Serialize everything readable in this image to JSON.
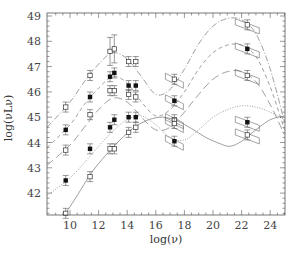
{
  "chart_data": {
    "type": "scatter",
    "title": "",
    "xlabel": "log(ν)",
    "ylabel": "log(νLν)",
    "xlim": [
      8.4,
      25.0
    ],
    "ylim": [
      41.05,
      49.2
    ],
    "grid": false,
    "legend": "none",
    "x_ticks": [
      10,
      12,
      14,
      16,
      18,
      20,
      22,
      24
    ],
    "y_ticks": [
      42,
      43,
      44,
      45,
      46,
      47,
      48,
      49
    ],
    "series": [
      {
        "name": "sequence-1",
        "marker": "open",
        "line": "dotted-long",
        "points": [
          [
            9.7,
            45.4
          ],
          [
            11.4,
            46.65
          ],
          [
            12.8,
            47.6
          ],
          [
            13.1,
            47.7
          ],
          [
            14.1,
            47.2
          ],
          [
            14.6,
            47.2
          ],
          [
            17.3,
            46.5
          ],
          [
            22.4,
            48.65
          ]
        ],
        "curve": [
          [
            8.4,
            44.6
          ],
          [
            10,
            45.6
          ],
          [
            11,
            46.4
          ],
          [
            12,
            47.1
          ],
          [
            13,
            47.55
          ],
          [
            14,
            47.3
          ],
          [
            15,
            46.6
          ],
          [
            16,
            45.9
          ],
          [
            17,
            46.1
          ],
          [
            18,
            46.9
          ],
          [
            19,
            47.9
          ],
          [
            20,
            48.6
          ],
          [
            21,
            48.9
          ],
          [
            22,
            48.85
          ],
          [
            23,
            48.3
          ],
          [
            24,
            46.9
          ],
          [
            25,
            44.8
          ]
        ]
      },
      {
        "name": "sequence-2",
        "marker": "filled",
        "line": "short-dash",
        "points": [
          [
            9.7,
            44.5
          ],
          [
            11.4,
            45.8
          ],
          [
            12.8,
            46.6
          ],
          [
            13.1,
            46.75
          ],
          [
            14.1,
            46.25
          ],
          [
            14.6,
            46.25
          ],
          [
            17.3,
            45.65
          ],
          [
            22.4,
            47.7
          ]
        ],
        "curve": [
          [
            8.4,
            43.8
          ],
          [
            10,
            44.7
          ],
          [
            11,
            45.5
          ],
          [
            12,
            46.15
          ],
          [
            13,
            46.6
          ],
          [
            14,
            46.35
          ],
          [
            15,
            45.6
          ],
          [
            16,
            45.05
          ],
          [
            17,
            45.3
          ],
          [
            18,
            46.0
          ],
          [
            19,
            46.9
          ],
          [
            20,
            47.55
          ],
          [
            21,
            47.85
          ],
          [
            22,
            47.85
          ],
          [
            23,
            47.4
          ],
          [
            24,
            46.2
          ],
          [
            25,
            44.5
          ]
        ]
      },
      {
        "name": "sequence-3",
        "marker": "open",
        "line": "long-dash",
        "points": [
          [
            9.7,
            43.7
          ],
          [
            11.4,
            45.1
          ],
          [
            12.8,
            46.05
          ],
          [
            13.1,
            46.05
          ],
          [
            14.1,
            45.9
          ],
          [
            14.6,
            45.8
          ],
          [
            17.3,
            44.9
          ],
          [
            22.4,
            46.65
          ]
        ],
        "curve": [
          [
            8.4,
            43.1
          ],
          [
            10,
            43.9
          ],
          [
            11,
            44.6
          ],
          [
            12,
            45.3
          ],
          [
            13,
            45.75
          ],
          [
            14,
            45.6
          ],
          [
            15,
            45.0
          ],
          [
            16,
            44.5
          ],
          [
            17,
            44.6
          ],
          [
            18,
            45.2
          ],
          [
            19,
            45.9
          ],
          [
            20,
            46.5
          ],
          [
            21,
            46.8
          ],
          [
            22,
            46.8
          ],
          [
            23,
            46.4
          ],
          [
            24,
            45.5
          ],
          [
            25,
            44.3
          ]
        ]
      },
      {
        "name": "sequence-4",
        "marker": "filled",
        "line": "dotted",
        "points": [
          [
            9.7,
            42.5
          ],
          [
            11.4,
            43.75
          ],
          [
            12.8,
            44.6
          ],
          [
            13.1,
            44.9
          ],
          [
            14.1,
            45.0
          ],
          [
            14.6,
            45.0
          ],
          [
            17.3,
            44.05
          ],
          [
            22.4,
            44.8
          ]
        ],
        "curve": [
          [
            8.4,
            41.9
          ],
          [
            10,
            42.6
          ],
          [
            11,
            43.2
          ],
          [
            12,
            43.85
          ],
          [
            13,
            44.45
          ],
          [
            14,
            44.9
          ],
          [
            15,
            45.05
          ],
          [
            16,
            44.7
          ],
          [
            17,
            44.2
          ],
          [
            18,
            44.1
          ],
          [
            19,
            44.5
          ],
          [
            20,
            45.0
          ],
          [
            21,
            45.3
          ],
          [
            22,
            45.45
          ],
          [
            23,
            45.4
          ],
          [
            24,
            45.2
          ],
          [
            25,
            44.9
          ]
        ]
      },
      {
        "name": "sequence-5",
        "marker": "open",
        "line": "solid",
        "points": [
          [
            9.7,
            41.2
          ],
          [
            11.4,
            42.65
          ],
          [
            12.8,
            43.75
          ],
          [
            13.1,
            43.75
          ],
          [
            14.1,
            44.4
          ],
          [
            14.6,
            44.6
          ],
          [
            17.3,
            44.75
          ],
          [
            22.4,
            44.3
          ]
        ],
        "curve": [
          [
            9.7,
            41.2
          ],
          [
            10.5,
            41.9
          ],
          [
            11.5,
            42.8
          ],
          [
            12.5,
            43.5
          ],
          [
            13.5,
            44.1
          ],
          [
            14.5,
            44.6
          ],
          [
            15.5,
            44.9
          ],
          [
            16.5,
            45.0
          ],
          [
            17.5,
            44.85
          ],
          [
            18.5,
            44.55
          ],
          [
            19.5,
            44.2
          ],
          [
            20.5,
            43.95
          ],
          [
            21.2,
            43.85
          ],
          [
            22,
            44.05
          ],
          [
            23,
            44.5
          ],
          [
            24,
            44.9
          ],
          [
            25,
            45.05
          ]
        ]
      }
    ],
    "annotations": []
  }
}
